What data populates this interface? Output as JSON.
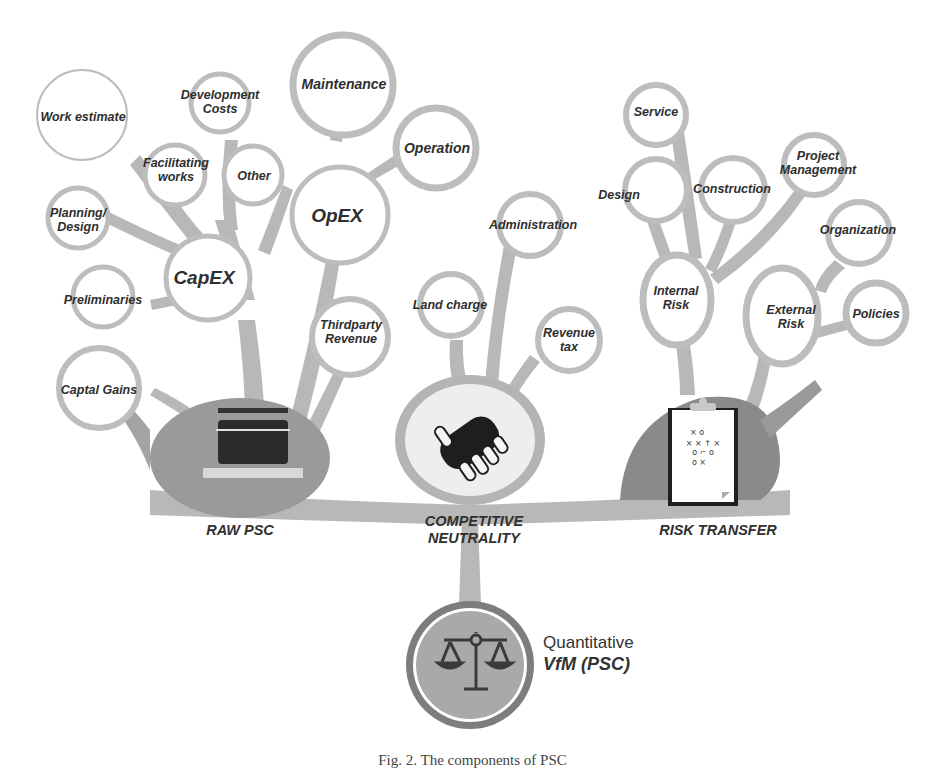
{
  "diagram": {
    "root": {
      "line1": "Quantitative",
      "line2": "VfM (PSC)",
      "icon": "balance-scale-icon"
    },
    "categories": [
      {
        "label": "RAW PSC",
        "icon": "printer-stack-icon"
      },
      {
        "label_line1": "COMPETITIVE",
        "label_line2": "NEUTRALITY",
        "icon": "handshake-icon"
      },
      {
        "label": "RISK TRANSFER",
        "icon": "clipboard-strategy-icon"
      }
    ],
    "raw_psc": {
      "capex": {
        "label": "CapEX",
        "children": [
          "Work estimate",
          "Development Costs",
          "Facilitating works",
          "Other",
          "Planning/ Design",
          "Preliminaries"
        ]
      },
      "opex": {
        "label": "OpEX",
        "children": [
          "Maintenance",
          "Operation"
        ]
      },
      "others": [
        "Captal Gains",
        "Thirdparty Revenue"
      ]
    },
    "competitive_neutrality": {
      "children": [
        "Land charge",
        "Administration",
        "Revenue tax"
      ]
    },
    "risk_transfer": {
      "internal": {
        "label": "Internal Risk",
        "children": [
          "Design",
          "Service",
          "Construction",
          "Project Management"
        ]
      },
      "external": {
        "label": "External Risk",
        "children": [
          "Organization",
          "Policies"
        ]
      }
    },
    "labels": {
      "work_estimate": "Work estimate",
      "dev_costs_1": "Development",
      "dev_costs_2": "Costs",
      "facilitating_1": "Facilitating",
      "facilitating_2": "works",
      "other": "Other",
      "planning_1": "Planning/",
      "planning_2": "Design",
      "preliminaries": "Preliminaries",
      "capex": "CapEX",
      "opex": "OpEX",
      "maintenance": "Maintenance",
      "operation": "Operation",
      "captal_gains": "Captal Gains",
      "thirdparty_1": "Thirdparty",
      "thirdparty_2": "Revenue",
      "land_charge": "Land charge",
      "administration": "Administration",
      "revenue_tax_1": "Revenue",
      "revenue_tax_2": "tax",
      "internal_risk_1": "Internal",
      "internal_risk_2": "Risk",
      "external_risk_1": "External",
      "external_risk_2": "Risk",
      "design": "Design",
      "service": "Service",
      "construction": "Construction",
      "project_mgmt_1": "Project",
      "project_mgmt_2": "Management",
      "organization": "Organization",
      "policies": "Policies",
      "raw_psc": "RAW PSC",
      "cn_1": "COMPETITIVE",
      "cn_2": "NEUTRALITY",
      "risk_transfer": "RISK TRANSFER"
    },
    "caption": "Fig. 2.  The components of PSC"
  },
  "colors": {
    "branch": "#b4b4b4",
    "node_fill": "#ffffff",
    "dark_blob": "#8e8e8e",
    "text": "#2e2e2e"
  }
}
